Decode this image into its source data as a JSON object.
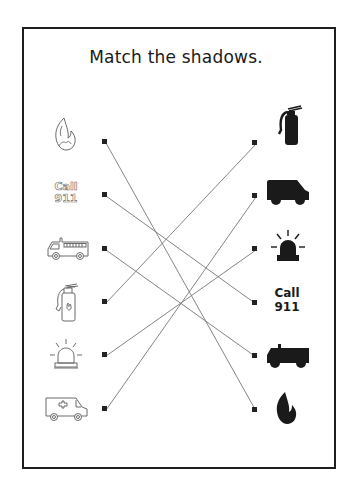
{
  "worksheet": {
    "title": "Match the shadows.",
    "instruction_type": "matching",
    "colors": {
      "outline": "#6a6a6a",
      "shadow": "#1a1a1a",
      "line": "#777777",
      "border": "#1e1e1e"
    }
  },
  "left_items": [
    {
      "id": "L1",
      "label": "fire",
      "icon": "fire-outline-icon",
      "dot": [
        104,
        141
      ]
    },
    {
      "id": "L2",
      "label": "Call 911",
      "text_line1": "Call",
      "text_line2": "911",
      "icon": "call-911-outline",
      "dot": [
        104,
        194
      ]
    },
    {
      "id": "L3",
      "label": "fire truck",
      "icon": "fire-truck-outline-icon",
      "dot": [
        104,
        248
      ]
    },
    {
      "id": "L4",
      "label": "fire extinguisher",
      "icon": "extinguisher-outline-icon",
      "dot": [
        104,
        301
      ]
    },
    {
      "id": "L5",
      "label": "siren light",
      "icon": "siren-outline-icon",
      "dot": [
        104,
        354
      ]
    },
    {
      "id": "L6",
      "label": "ambulance",
      "icon": "ambulance-outline-icon",
      "dot": [
        104,
        408
      ]
    }
  ],
  "right_items": [
    {
      "id": "R1",
      "label": "fire extinguisher shadow",
      "icon": "extinguisher-shadow-icon",
      "dot": [
        254,
        142
      ]
    },
    {
      "id": "R2",
      "label": "ambulance shadow",
      "icon": "ambulance-shadow-icon",
      "dot": [
        254,
        195
      ]
    },
    {
      "id": "R3",
      "label": "siren light shadow",
      "icon": "siren-shadow-icon",
      "dot": [
        254,
        248
      ]
    },
    {
      "id": "R4",
      "label": "Call 911 shadow",
      "text_line1": "Call",
      "text_line2": "911",
      "icon": "call-911-solid",
      "dot": [
        254,
        302
      ]
    },
    {
      "id": "R5",
      "label": "fire truck shadow",
      "icon": "fire-truck-shadow-icon",
      "dot": [
        254,
        355
      ]
    },
    {
      "id": "R6",
      "label": "fire shadow",
      "icon": "fire-shadow-icon",
      "dot": [
        254,
        409
      ]
    }
  ],
  "matches": [
    {
      "from": "L1",
      "to": "R6"
    },
    {
      "from": "L2",
      "to": "R4"
    },
    {
      "from": "L3",
      "to": "R5"
    },
    {
      "from": "L4",
      "to": "R1"
    },
    {
      "from": "L5",
      "to": "R3"
    },
    {
      "from": "L6",
      "to": "R2"
    }
  ]
}
